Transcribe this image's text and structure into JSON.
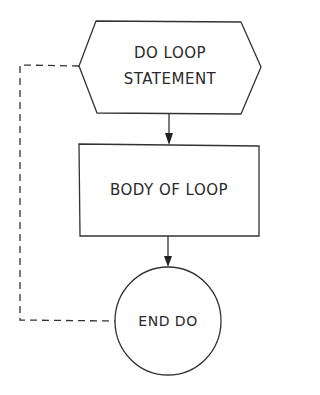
{
  "diagram": {
    "type": "flowchart",
    "colors": {
      "stroke": "#333333",
      "background": "#ffffff",
      "text": "#2a2a2a"
    },
    "nodes": [
      {
        "id": "start",
        "shape": "hexagon",
        "label_line1": "DO LOOP",
        "label_line2": "STATEMENT"
      },
      {
        "id": "body",
        "shape": "rectangle",
        "label": "BODY OF LOOP"
      },
      {
        "id": "end",
        "shape": "circle",
        "label": "END DO"
      }
    ],
    "edges": [
      {
        "from": "start",
        "to": "body",
        "style": "solid-arrow"
      },
      {
        "from": "body",
        "to": "end",
        "style": "solid-arrow"
      },
      {
        "from": "end",
        "to": "start",
        "style": "dashed"
      }
    ]
  }
}
